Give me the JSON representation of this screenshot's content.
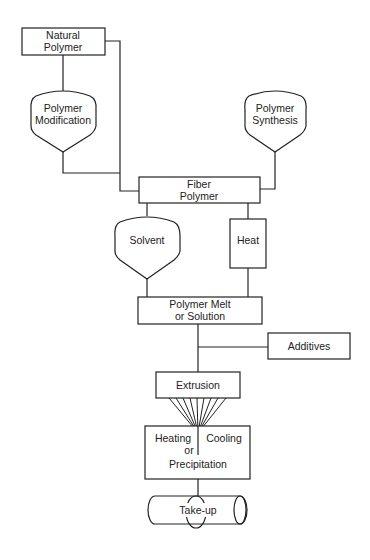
{
  "diagram": {
    "colors": {
      "stroke": "#222222",
      "background": "#ffffff",
      "text": "#222222"
    },
    "nodes": {
      "natural_polymer": {
        "shape": "rectangle",
        "line1": "Natural",
        "line2": "Polymer"
      },
      "polymer_modification": {
        "shape": "funnel",
        "line1": "Polymer",
        "line2": "Modification"
      },
      "polymer_synthesis": {
        "shape": "funnel",
        "line1": "Polymer",
        "line2": "Synthesis"
      },
      "fiber_polymer": {
        "shape": "rectangle",
        "line1": "Fiber",
        "line2": "Polymer"
      },
      "solvent": {
        "shape": "funnel",
        "label": "Solvent"
      },
      "heat": {
        "shape": "rectangle",
        "label": "Heat"
      },
      "polymer_melt": {
        "shape": "rectangle",
        "line1": "Polymer Melt",
        "line2": "or Solution"
      },
      "additives": {
        "shape": "rectangle",
        "label": "Additives"
      },
      "extrusion": {
        "shape": "rectangle",
        "label": "Extrusion"
      },
      "heating_cooling": {
        "shape": "rectangle",
        "left": "Heating",
        "right": "Cooling",
        "line2": "or",
        "line3": "Precipitation"
      },
      "take_up": {
        "shape": "cylinder",
        "label": "Take-up"
      }
    },
    "edges": [
      {
        "from": "natural_polymer",
        "to": "polymer_modification"
      },
      {
        "from": "natural_polymer",
        "to": "fiber_polymer"
      },
      {
        "from": "polymer_modification",
        "to": "fiber_polymer"
      },
      {
        "from": "polymer_synthesis",
        "to": "fiber_polymer"
      },
      {
        "from": "fiber_polymer",
        "to": "solvent"
      },
      {
        "from": "fiber_polymer",
        "to": "heat"
      },
      {
        "from": "solvent",
        "to": "polymer_melt"
      },
      {
        "from": "heat",
        "to": "polymer_melt"
      },
      {
        "from": "additives",
        "to": "polymer_melt-extrusion-line"
      },
      {
        "from": "polymer_melt",
        "to": "extrusion"
      },
      {
        "from": "extrusion",
        "to": "heating_cooling",
        "style": "filament-fan",
        "count": 9
      },
      {
        "from": "heating_cooling",
        "to": "take_up"
      }
    ]
  }
}
